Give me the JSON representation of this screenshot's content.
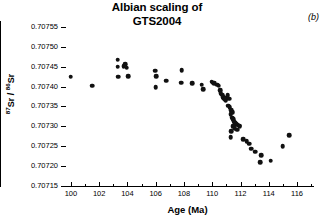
{
  "chart_data": {
    "type": "scatter",
    "title": "Albian scaling of GTS2004",
    "title_line1": "Albian scaling of",
    "title_line2": "GTS2004",
    "panel_label": "(b)",
    "xlabel": "Age  (Ma)",
    "ylabel": "87Sr / 86Sr",
    "ylabel_numerator": "87",
    "ylabel_denominator": "86",
    "ylabel_element": "Sr",
    "xlim": [
      99.3,
      117.2
    ],
    "ylim": [
      0.70715,
      0.707565
    ],
    "grid": false,
    "legend": null,
    "marker": "filled-circle",
    "marker_color": "#111111",
    "xticks_major": [
      100,
      102,
      104,
      106,
      108,
      110,
      112,
      114,
      116
    ],
    "xtick_labels": [
      "100",
      "102",
      "104",
      "106",
      "108",
      "110",
      "112",
      "114",
      "116"
    ],
    "xticks_minor": [
      101,
      103,
      105,
      107,
      109,
      111,
      113,
      115,
      117
    ],
    "yticks_major": [
      0.70715,
      0.7072,
      0.70725,
      0.7073,
      0.70735,
      0.7074,
      0.70745,
      0.7075,
      0.70755
    ],
    "ytick_labels": [
      "0.70715",
      "0.70720",
      "0.70725",
      "0.70730",
      "0.70735",
      "0.70740",
      "0.70745",
      "0.70750",
      "0.70755"
    ],
    "points": [
      {
        "x": 100.0,
        "y": 0.707425
      },
      {
        "x": 101.5,
        "y": 0.707402
      },
      {
        "x": 103.3,
        "y": 0.707468
      },
      {
        "x": 103.3,
        "y": 0.70745
      },
      {
        "x": 103.35,
        "y": 0.707425
      },
      {
        "x": 103.75,
        "y": 0.707452
      },
      {
        "x": 103.85,
        "y": 0.707456
      },
      {
        "x": 103.95,
        "y": 0.707448
      },
      {
        "x": 104.05,
        "y": 0.707426
      },
      {
        "x": 105.95,
        "y": 0.70744
      },
      {
        "x": 106.05,
        "y": 0.707426
      },
      {
        "x": 106.0,
        "y": 0.707399
      },
      {
        "x": 106.75,
        "y": 0.707415
      },
      {
        "x": 107.85,
        "y": 0.707441
      },
      {
        "x": 107.8,
        "y": 0.70741
      },
      {
        "x": 108.6,
        "y": 0.707408
      },
      {
        "x": 109.25,
        "y": 0.707405
      },
      {
        "x": 109.35,
        "y": 0.707394
      },
      {
        "x": 109.95,
        "y": 0.707412
      },
      {
        "x": 110.05,
        "y": 0.70741
      },
      {
        "x": 110.15,
        "y": 0.707408
      },
      {
        "x": 110.35,
        "y": 0.707405
      },
      {
        "x": 110.45,
        "y": 0.707402
      },
      {
        "x": 110.55,
        "y": 0.707391
      },
      {
        "x": 110.6,
        "y": 0.707384
      },
      {
        "x": 110.7,
        "y": 0.70738
      },
      {
        "x": 110.78,
        "y": 0.707374
      },
      {
        "x": 110.85,
        "y": 0.70737
      },
      {
        "x": 110.9,
        "y": 0.707368
      },
      {
        "x": 110.95,
        "y": 0.707366
      },
      {
        "x": 111.0,
        "y": 0.707372
      },
      {
        "x": 111.1,
        "y": 0.707378
      },
      {
        "x": 111.2,
        "y": 0.70737
      },
      {
        "x": 111.15,
        "y": 0.707352
      },
      {
        "x": 111.25,
        "y": 0.707348
      },
      {
        "x": 111.35,
        "y": 0.70734
      },
      {
        "x": 111.45,
        "y": 0.707336
      },
      {
        "x": 111.3,
        "y": 0.70733
      },
      {
        "x": 111.4,
        "y": 0.707322
      },
      {
        "x": 111.5,
        "y": 0.707318
      },
      {
        "x": 111.55,
        "y": 0.707312
      },
      {
        "x": 111.62,
        "y": 0.707308
      },
      {
        "x": 111.7,
        "y": 0.707305
      },
      {
        "x": 111.8,
        "y": 0.707304
      },
      {
        "x": 111.9,
        "y": 0.707302
      },
      {
        "x": 111.45,
        "y": 0.7073
      },
      {
        "x": 111.6,
        "y": 0.707296
      },
      {
        "x": 111.75,
        "y": 0.707292
      },
      {
        "x": 111.35,
        "y": 0.707288
      },
      {
        "x": 111.95,
        "y": 0.7073
      },
      {
        "x": 111.3,
        "y": 0.707272
      },
      {
        "x": 112.2,
        "y": 0.707268
      },
      {
        "x": 112.45,
        "y": 0.707262
      },
      {
        "x": 112.6,
        "y": 0.707256
      },
      {
        "x": 112.75,
        "y": 0.707244
      },
      {
        "x": 113.05,
        "y": 0.707236
      },
      {
        "x": 113.45,
        "y": 0.707228
      },
      {
        "x": 113.4,
        "y": 0.70721
      },
      {
        "x": 114.15,
        "y": 0.707214
      },
      {
        "x": 115.0,
        "y": 0.70725
      },
      {
        "x": 115.45,
        "y": 0.707278
      }
    ]
  }
}
